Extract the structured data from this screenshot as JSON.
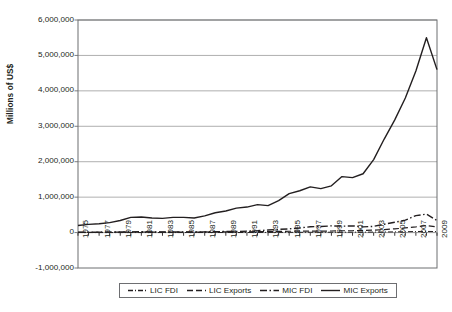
{
  "chart_data": {
    "type": "line",
    "title": "",
    "xlabel": "",
    "ylabel": "Millions of US$",
    "ylim": [
      -1000000,
      6000000
    ],
    "xlim": [
      1975,
      2009
    ],
    "grid": true,
    "legend_position": "bottom",
    "y_ticks": [
      "6,000,000",
      "5,000,000",
      "4,000,000",
      "3,000,000",
      "2,000,000",
      "1,000,000",
      "0",
      "-1,000,000"
    ],
    "y_tick_values": [
      6000000,
      5000000,
      4000000,
      3000000,
      2000000,
      1000000,
      0,
      -1000000
    ],
    "x": [
      1975,
      1976,
      1977,
      1978,
      1979,
      1980,
      1981,
      1982,
      1983,
      1984,
      1985,
      1986,
      1987,
      1988,
      1989,
      1990,
      1991,
      1992,
      1993,
      1994,
      1995,
      1996,
      1997,
      1998,
      1999,
      2000,
      2001,
      2002,
      2003,
      2004,
      2005,
      2006,
      2007,
      2008,
      2009
    ],
    "x_tick_labels": [
      "1975",
      "1977",
      "1979",
      "1981",
      "1983",
      "1985",
      "1987",
      "1989",
      "1991",
      "1993",
      "1995",
      "1997",
      "1999",
      "2001",
      "2003",
      "2005",
      "2007",
      "2009"
    ],
    "series": [
      {
        "name": "LIC FDI",
        "style": "dashdot",
        "color": "#231f20",
        "width": 1.0,
        "values": [
          300,
          400,
          500,
          600,
          700,
          900,
          1000,
          900,
          800,
          900,
          1000,
          1100,
          1300,
          1600,
          2000,
          2400,
          2800,
          3300,
          4000,
          5000,
          6000,
          7000,
          8500,
          9000,
          9500,
          10000,
          11000,
          12000,
          14000,
          17000,
          20000,
          24000,
          30000,
          33000,
          28000
        ]
      },
      {
        "name": "LIC Exports",
        "style": "dashed",
        "color": "#231f20",
        "width": 1.2,
        "values": [
          8000,
          9000,
          10000,
          11000,
          13000,
          16000,
          16000,
          15000,
          14000,
          15000,
          15000,
          14000,
          16000,
          18000,
          20000,
          22000,
          23000,
          25000,
          27000,
          31000,
          37000,
          40000,
          43000,
          42000,
          44000,
          52000,
          52000,
          57000,
          68000,
          85000,
          105000,
          130000,
          160000,
          200000,
          160000
        ]
      },
      {
        "name": "MIC FDI",
        "style": "dashdot-long",
        "color": "#231f20",
        "width": 1.4,
        "values": [
          9000,
          10000,
          11000,
          13000,
          15000,
          18000,
          22000,
          21000,
          17000,
          16000,
          16000,
          17000,
          20000,
          26000,
          29000,
          31000,
          40000,
          52000,
          72000,
          91000,
          105000,
          130000,
          165000,
          170000,
          190000,
          180000,
          190000,
          160000,
          175000,
          235000,
          290000,
          350000,
          480000,
          520000,
          340000
        ]
      },
      {
        "name": "MIC Exports",
        "style": "solid",
        "color": "#231f20",
        "width": 1.4,
        "values": [
          200000,
          230000,
          250000,
          280000,
          340000,
          430000,
          440000,
          410000,
          400000,
          430000,
          430000,
          410000,
          470000,
          560000,
          610000,
          690000,
          720000,
          790000,
          760000,
          900000,
          1100000,
          1180000,
          1290000,
          1240000,
          1320000,
          1580000,
          1550000,
          1660000,
          2060000,
          2640000,
          3180000,
          3800000,
          4560000,
          5500000,
          4600000
        ]
      }
    ]
  },
  "legend": {
    "items": [
      {
        "label": "LIC FDI",
        "style": "dashdot"
      },
      {
        "label": "LIC Exports",
        "style": "dashed"
      },
      {
        "label": "MIC FDI",
        "style": "dashdot-long"
      },
      {
        "label": "MIC Exports",
        "style": "solid"
      }
    ]
  },
  "colors": {
    "line": "#231f20",
    "grid": "#9a9a9a",
    "axis": "#6d6e71",
    "background": "#ffffff"
  }
}
